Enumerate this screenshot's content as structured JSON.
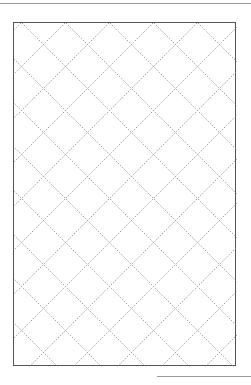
{
  "page": {
    "pattern": "diamond-lattice",
    "line_color": "#8a8a8a",
    "border_color": "#555555",
    "rule_color": "#9a9a9a"
  }
}
